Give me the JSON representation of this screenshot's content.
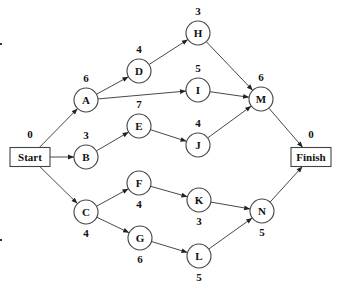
{
  "diagram": {
    "type": "activity-on-node network",
    "nodes": [
      {
        "id": "Start",
        "label": "Start",
        "duration": "0",
        "shape": "box",
        "x": 30,
        "y": 157,
        "dur_pos": "above"
      },
      {
        "id": "A",
        "label": "A",
        "duration": "6",
        "shape": "circle",
        "x": 86,
        "y": 100,
        "dur_pos": "above"
      },
      {
        "id": "B",
        "label": "B",
        "duration": "3",
        "shape": "circle",
        "x": 86,
        "y": 157,
        "dur_pos": "above"
      },
      {
        "id": "C",
        "label": "C",
        "duration": "4",
        "shape": "circle",
        "x": 86,
        "y": 212,
        "dur_pos": "below"
      },
      {
        "id": "D",
        "label": "D",
        "duration": "4",
        "shape": "circle",
        "x": 139,
        "y": 71,
        "dur_pos": "above"
      },
      {
        "id": "E",
        "label": "E",
        "duration": "7",
        "shape": "circle",
        "x": 139,
        "y": 126,
        "dur_pos": "above"
      },
      {
        "id": "F",
        "label": "F",
        "duration": "4",
        "shape": "circle",
        "x": 139,
        "y": 183,
        "dur_pos": "below"
      },
      {
        "id": "G",
        "label": "G",
        "duration": "6",
        "shape": "circle",
        "x": 140,
        "y": 238,
        "dur_pos": "below"
      },
      {
        "id": "H",
        "label": "H",
        "duration": "3",
        "shape": "circle",
        "x": 198,
        "y": 33,
        "dur_pos": "above"
      },
      {
        "id": "I",
        "label": "I",
        "duration": "5",
        "shape": "circle",
        "x": 198,
        "y": 90,
        "dur_pos": "above"
      },
      {
        "id": "J",
        "label": "J",
        "duration": "4",
        "shape": "circle",
        "x": 198,
        "y": 145,
        "dur_pos": "above"
      },
      {
        "id": "K",
        "label": "K",
        "duration": "3",
        "shape": "circle",
        "x": 199,
        "y": 200,
        "dur_pos": "below"
      },
      {
        "id": "L",
        "label": "L",
        "duration": "5",
        "shape": "circle",
        "x": 199,
        "y": 256,
        "dur_pos": "below"
      },
      {
        "id": "M",
        "label": "M",
        "duration": "6",
        "shape": "circle",
        "x": 261,
        "y": 99,
        "dur_pos": "above"
      },
      {
        "id": "N",
        "label": "N",
        "duration": "5",
        "shape": "circle",
        "x": 262,
        "y": 211,
        "dur_pos": "below"
      },
      {
        "id": "Finish",
        "label": "Finish",
        "duration": "0",
        "shape": "box",
        "x": 311,
        "y": 157,
        "dur_pos": "above"
      }
    ],
    "edges": [
      [
        "Start",
        "A"
      ],
      [
        "Start",
        "B"
      ],
      [
        "Start",
        "C"
      ],
      [
        "A",
        "D"
      ],
      [
        "A",
        "I"
      ],
      [
        "B",
        "E"
      ],
      [
        "C",
        "F"
      ],
      [
        "C",
        "G"
      ],
      [
        "D",
        "H"
      ],
      [
        "E",
        "J"
      ],
      [
        "F",
        "K"
      ],
      [
        "G",
        "L"
      ],
      [
        "H",
        "M"
      ],
      [
        "I",
        "M"
      ],
      [
        "J",
        "M"
      ],
      [
        "K",
        "N"
      ],
      [
        "L",
        "N"
      ],
      [
        "M",
        "Finish"
      ],
      [
        "N",
        "Finish"
      ]
    ]
  }
}
